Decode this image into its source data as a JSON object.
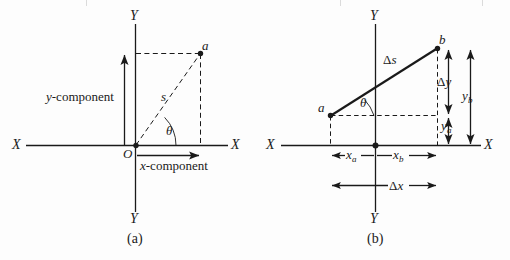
{
  "figure": {
    "panels": [
      {
        "caption": "(a)",
        "axis_labels": {
          "x_left": "X",
          "x_right": "X",
          "y_top": "Y",
          "y_bottom": "Y"
        },
        "origin_label": "O",
        "point_label": "a",
        "vector_label": "s",
        "angle_label": "θ",
        "y_component_label": "y-component",
        "x_component_label": "x-component"
      },
      {
        "caption": "(b)",
        "axis_labels": {
          "x_left": "X",
          "x_right": "X",
          "y_top": "Y",
          "y_bottom": "Y"
        },
        "point_a_label": "a",
        "point_b_label": "b",
        "vector_label": "Δs",
        "angle_label": "θ",
        "delta_y_label": "Δy",
        "delta_x_label": "Δx",
        "y_a_base": "y",
        "y_a_sub": "a",
        "y_b_base": "y",
        "y_b_sub": "b",
        "x_a_base": "x",
        "x_a_sub": "a",
        "x_b_base": "x",
        "x_b_sub": "b"
      }
    ],
    "colors": {
      "ink": "#1a1a1a",
      "paper": "#fdfdfd"
    }
  }
}
